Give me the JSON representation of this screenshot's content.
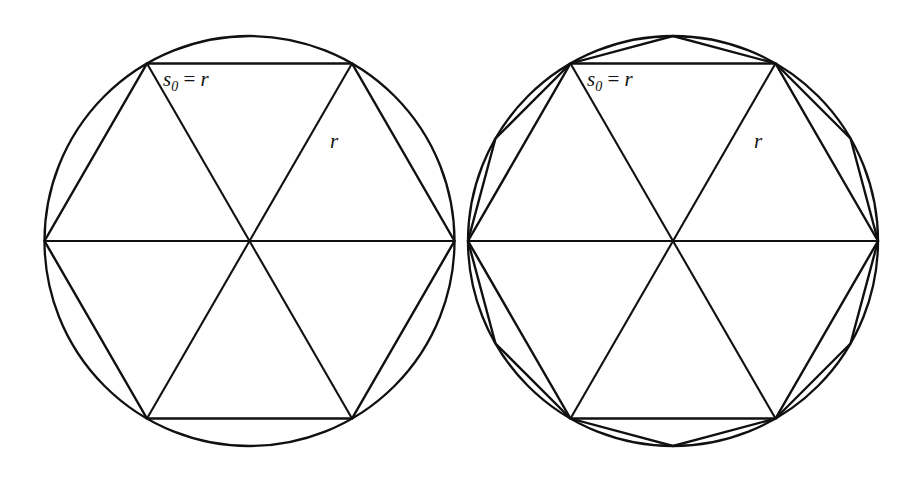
{
  "figure": {
    "background_color": "#ffffff",
    "stroke_color": "#101010",
    "panels": [
      {
        "id": "left-panel",
        "name": "hexagon-in-circle",
        "center_x": 249.5,
        "center_y": 241,
        "radius": 205,
        "shapes": [
          "circle",
          "hexagon",
          "radii"
        ],
        "labels": {
          "side_label_s": "s",
          "side_label_sub": "0",
          "side_label_eq": " = ",
          "side_label_r": "r",
          "side_label_full": "s0 = r",
          "radius_label": "r"
        }
      },
      {
        "id": "right-panel",
        "name": "hexagon-and-dodecagon-in-circle",
        "center_x": 673,
        "center_y": 241,
        "radius": 205,
        "shapes": [
          "circle",
          "hexagon",
          "dodecagon",
          "radii"
        ],
        "labels": {
          "side_label_s": "s",
          "side_label_sub": "0",
          "side_label_eq": " = ",
          "side_label_r": "r",
          "side_label_full": "s0 = r",
          "radius_label": "r"
        }
      }
    ]
  },
  "chart_data": {
    "type": "diagram",
    "title": "",
    "panels": [
      {
        "name": "left",
        "circle": {
          "cx": 249.5,
          "cy": 241,
          "r": 205
        },
        "hexagon_vertices_deg": [
          0,
          60,
          120,
          180,
          240,
          300
        ],
        "dodecagon_vertices_deg": [],
        "annotations": [
          {
            "text": "s0 = r",
            "x": 165,
            "y": 85,
            "refers_to": "top-hexagon-side"
          },
          {
            "text": "r",
            "x": 333,
            "y": 145,
            "refers_to": "upper-right-radius"
          }
        ]
      },
      {
        "name": "right",
        "circle": {
          "cx": 673,
          "cy": 241,
          "r": 205
        },
        "hexagon_vertices_deg": [
          0,
          60,
          120,
          180,
          240,
          300
        ],
        "dodecagon_vertices_deg": [
          0,
          30,
          60,
          90,
          120,
          150,
          180,
          210,
          240,
          270,
          300,
          330
        ],
        "annotations": [
          {
            "text": "s0 = r",
            "x": 589,
            "y": 85,
            "refers_to": "top-hexagon-side"
          },
          {
            "text": "r",
            "x": 757,
            "y": 145,
            "refers_to": "upper-right-radius"
          }
        ]
      }
    ]
  }
}
